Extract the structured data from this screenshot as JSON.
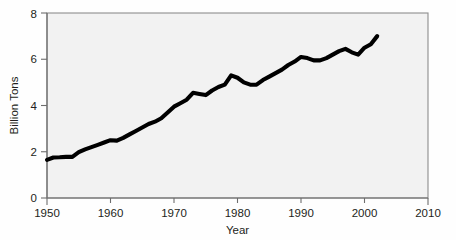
{
  "chart_data": {
    "type": "line",
    "title": "",
    "subtitle": "",
    "xlabel": "Year",
    "ylabel": "Billion Tons",
    "xlim": [
      1950,
      2010
    ],
    "ylim": [
      0,
      8
    ],
    "xticks": [
      1950,
      1960,
      1970,
      1980,
      1990,
      2000,
      2010
    ],
    "xtick_labels": [
      "1950",
      "1960",
      "1970",
      "1980",
      "1990",
      "2000",
      "2010"
    ],
    "yticks": [
      0,
      2,
      4,
      6,
      8
    ],
    "ytick_labels": [
      "0",
      "2",
      "4",
      "6",
      "8"
    ],
    "grid": false,
    "legend": null,
    "annotations": [],
    "series": [
      {
        "name": "Carbon Emissions",
        "color": "#000000",
        "line_width": 4,
        "x": [
          1950,
          1951,
          1952,
          1953,
          1954,
          1955,
          1956,
          1957,
          1958,
          1959,
          1960,
          1961,
          1962,
          1963,
          1964,
          1965,
          1966,
          1967,
          1968,
          1969,
          1970,
          1971,
          1972,
          1973,
          1974,
          1975,
          1976,
          1977,
          1978,
          1979,
          1980,
          1981,
          1982,
          1983,
          1984,
          1985,
          1986,
          1987,
          1988,
          1989,
          1990,
          1991,
          1992,
          1993,
          1994,
          1995,
          1996,
          1997,
          1998,
          1999,
          2000,
          2001,
          2002
        ],
        "values": [
          1.65,
          1.75,
          1.76,
          1.78,
          1.78,
          1.98,
          2.1,
          2.2,
          2.3,
          2.4,
          2.5,
          2.48,
          2.6,
          2.75,
          2.9,
          3.05,
          3.2,
          3.3,
          3.45,
          3.7,
          3.95,
          4.1,
          4.25,
          4.55,
          4.5,
          4.45,
          4.65,
          4.8,
          4.9,
          5.3,
          5.2,
          5.0,
          4.9,
          4.9,
          5.1,
          5.25,
          5.4,
          5.55,
          5.75,
          5.9,
          6.1,
          6.05,
          5.95,
          5.95,
          6.05,
          6.2,
          6.35,
          6.45,
          6.3,
          6.2,
          6.5,
          6.65,
          7.0
        ]
      }
    ]
  },
  "axes": {
    "ylabel": "Billion Tons",
    "xlabel": "Year"
  }
}
